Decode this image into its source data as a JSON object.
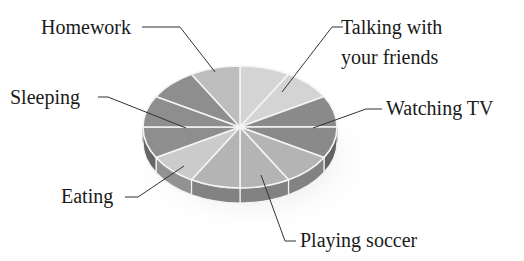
{
  "chart_data": {
    "type": "pie",
    "title": "",
    "style": "3d",
    "slice_unit": "equal 30-degree sectors (12 total)",
    "categories": [
      "Talking with your friends",
      "Watching TV",
      "Playing soccer",
      "Eating",
      "Sleeping",
      "Homework"
    ],
    "values": [
      2,
      2,
      3,
      1,
      3,
      1
    ],
    "slices_total": 12,
    "colors": [
      "#d4d4d4",
      "#8a8a8a",
      "#b4b4b4",
      "#cbcbcb",
      "#8e8e8e",
      "#bdbdbd"
    ],
    "legend": "none (callout labels)"
  },
  "labels": {
    "homework": "Homework",
    "talking_line1": "Talking with",
    "talking_line2": "your friends",
    "sleeping": "Sleeping",
    "watching_tv": "Watching TV",
    "eating": "Eating",
    "playing_soccer": "Playing soccer"
  }
}
